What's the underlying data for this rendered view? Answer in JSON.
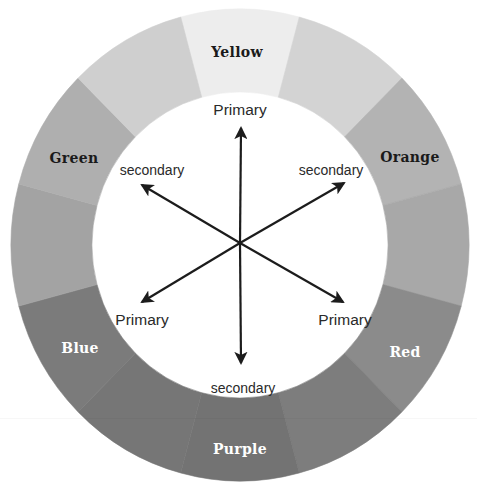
{
  "diagram": {
    "type": "color-wheel",
    "center": {
      "x": 240,
      "y": 245
    },
    "ring": {
      "outer_rx": 229,
      "outer_ry": 236,
      "inner_rx": 148,
      "inner_ry": 153
    },
    "segments": [
      {
        "name": "yellow",
        "label": "Yellow",
        "start": -15,
        "end": 15,
        "fill": "#ededed",
        "label_color": "#1a1a1a",
        "label_x": 237,
        "label_y": 57
      },
      {
        "name": "yellow-orange",
        "label": "",
        "start": 15,
        "end": 45,
        "fill": "#d3d3d3"
      },
      {
        "name": "orange",
        "label": "Orange",
        "start": 45,
        "end": 75,
        "fill": "#b3b3b3",
        "label_color": "#1a1a1a",
        "label_x": 410,
        "label_y": 162
      },
      {
        "name": "red-orange",
        "label": "",
        "start": 75,
        "end": 105,
        "fill": "#a8a8a8"
      },
      {
        "name": "red",
        "label": "Red",
        "start": 105,
        "end": 135,
        "fill": "#8b8b8b",
        "label_color": "#ffffff",
        "label_x": 405,
        "label_y": 357
      },
      {
        "name": "red-purple",
        "label": "",
        "start": 135,
        "end": 165,
        "fill": "#7d7d7d"
      },
      {
        "name": "purple",
        "label": "Purple",
        "start": 165,
        "end": 195,
        "fill": "#737373",
        "label_color": "#ffffff",
        "label_x": 240,
        "label_y": 454
      },
      {
        "name": "blue-purple",
        "label": "",
        "start": 195,
        "end": 225,
        "fill": "#767676"
      },
      {
        "name": "blue",
        "label": "Blue",
        "start": 225,
        "end": 255,
        "fill": "#7b7b7b",
        "label_color": "#ffffff",
        "label_x": 80,
        "label_y": 353
      },
      {
        "name": "blue-green",
        "label": "",
        "start": 255,
        "end": 285,
        "fill": "#a3a3a3"
      },
      {
        "name": "green",
        "label": "Green",
        "start": 285,
        "end": 315,
        "fill": "#afafaf",
        "label_color": "#1a1a1a",
        "label_x": 74,
        "label_y": 163
      },
      {
        "name": "yellow-green",
        "label": "",
        "start": 315,
        "end": 345,
        "fill": "#cfcfcf"
      }
    ],
    "arrows": [
      {
        "name": "arrow-up",
        "x": 241,
        "y": 128,
        "label": "Primary",
        "label_x": 240,
        "label_y": 115,
        "size": "large"
      },
      {
        "name": "arrow-upper-right",
        "x": 344,
        "y": 183,
        "label": "secondary",
        "label_x": 331,
        "label_y": 175,
        "size": "small"
      },
      {
        "name": "arrow-lower-right",
        "x": 343,
        "y": 302,
        "label": "Primary",
        "label_x": 345,
        "label_y": 325,
        "size": "large"
      },
      {
        "name": "arrow-down",
        "x": 241,
        "y": 363,
        "label": "secondary",
        "label_x": 243,
        "label_y": 393,
        "size": "small"
      },
      {
        "name": "arrow-lower-left",
        "x": 142,
        "y": 302,
        "label": "Primary",
        "label_x": 142,
        "label_y": 325,
        "size": "large"
      },
      {
        "name": "arrow-upper-left",
        "x": 142,
        "y": 185,
        "label": "secondary",
        "label_x": 152,
        "label_y": 175,
        "size": "small"
      }
    ],
    "arrow_color": "#1c1c1c"
  }
}
